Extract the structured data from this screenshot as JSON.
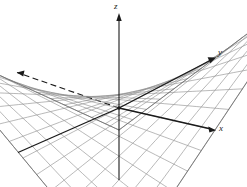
{
  "figure": {
    "title": "",
    "background_color": "#ffffff",
    "width": 247,
    "height": 187
  },
  "axes": {
    "z_label": "z",
    "y_label": "y",
    "x_label": "x",
    "axis_color": "#1a1a1a",
    "hidden_axis_style": "dashed"
  },
  "surface": {
    "mesh_color": "#8a8a8a",
    "mesh_color_dark": "#6e6e6e",
    "style": "wireframe"
  },
  "chart_data": {
    "type": "surface3d",
    "title": "",
    "xlabel": "x",
    "ylabel": "y",
    "zlabel": "z",
    "function": "z = x*y",
    "xlim": [
      -2,
      2
    ],
    "ylim": [
      -2,
      2
    ],
    "zlim": [
      -4,
      4
    ],
    "grid": true,
    "legend": false,
    "u_divisions": 14,
    "v_divisions": 14,
    "projection": {
      "origin_px": [
        119,
        108
      ],
      "x_axis_tip_px": [
        215,
        130
      ],
      "y_axis_tip_px": [
        215,
        58
      ],
      "z_axis_tip_px": [
        119,
        14
      ],
      "x_axis_neg_px": [
        17,
        153
      ],
      "y_axis_neg_px": [
        13,
        74
      ],
      "z_axis_neg_px": [
        119,
        180
      ]
    }
  }
}
